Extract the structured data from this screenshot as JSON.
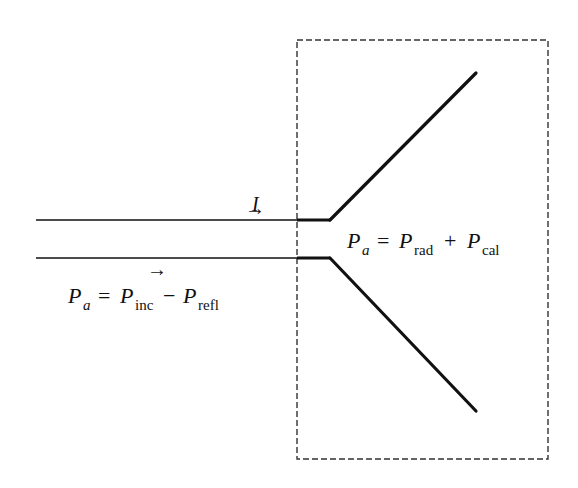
{
  "diagram": {
    "current_label": "I",
    "lower_arrow": "→",
    "upper_arrow": "→",
    "eq_left": {
      "lhs": "P",
      "lhs_sub": "a",
      "op1": "=",
      "t1": "P",
      "t1_sub": "inc",
      "op2": "−",
      "t2": "P",
      "t2_sub": "refl"
    },
    "eq_right": {
      "lhs": "P",
      "lhs_sub": "a",
      "op1": "=",
      "t1": "P",
      "t1_sub": "rad",
      "op2": "+",
      "t2": "P",
      "t2_sub": "cal"
    },
    "colors": {
      "line": "#111111",
      "box": "#333333"
    }
  }
}
